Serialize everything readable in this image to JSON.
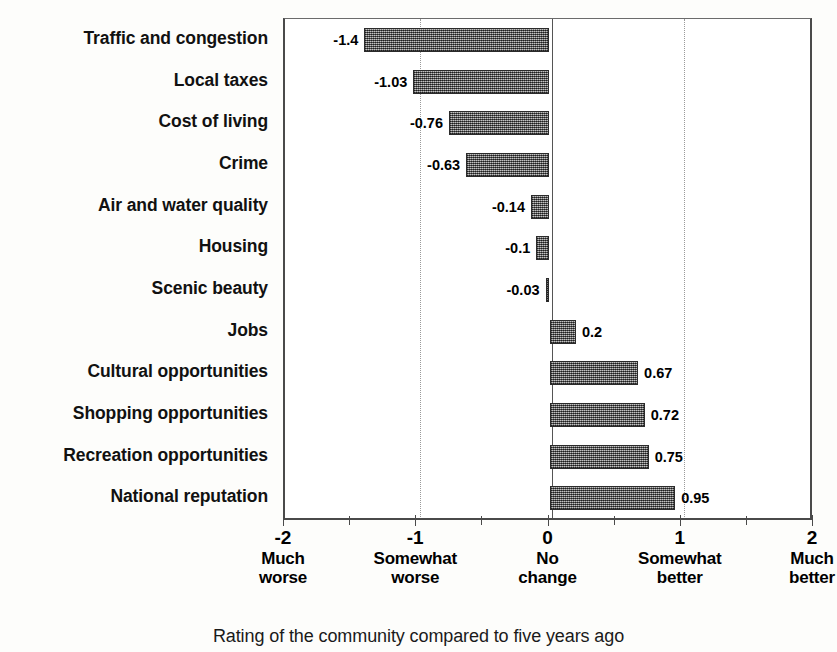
{
  "chart_data": {
    "type": "bar",
    "orientation": "horizontal",
    "title": "",
    "xlabel": "Rating of the community compared to five years ago",
    "ylabel": "",
    "xlim": [
      -2,
      2
    ],
    "grid": "dotted vertical gridlines at -1 and +1",
    "legend": "none",
    "categories": [
      "Traffic and congestion",
      "Local taxes",
      "Cost of living",
      "Crime",
      "Air and water quality",
      "Housing",
      "Scenic beauty",
      "Jobs",
      "Cultural opportunities",
      "Shopping opportunities",
      "Recreation opportunities",
      "National reputation"
    ],
    "values": [
      -1.4,
      -1.03,
      -0.76,
      -0.63,
      -0.14,
      -0.1,
      -0.03,
      0.2,
      0.67,
      0.72,
      0.75,
      0.95
    ],
    "value_labels": [
      "-1.4",
      "-1.03",
      "-0.76",
      "-0.63",
      "-0.14",
      "-0.1",
      "-0.03",
      "0.2",
      "0.67",
      "0.72",
      "0.75",
      "0.95"
    ],
    "xticks": [
      {
        "value": -2,
        "num": "-2",
        "line1": "Much",
        "line2": "worse"
      },
      {
        "value": -1,
        "num": "-1",
        "line1": "Somewhat",
        "line2": "worse"
      },
      {
        "value": 0,
        "num": "0",
        "line1": "No",
        "line2": "change"
      },
      {
        "value": 1,
        "num": "1",
        "line1": "Somewhat",
        "line2": "better"
      },
      {
        "value": 2,
        "num": "2",
        "line1": "Much",
        "line2": "better"
      }
    ],
    "minor_ticks": [
      -1.5,
      -0.5,
      0.5,
      1.5
    ],
    "gridlines": [
      -1,
      1
    ],
    "colors": {
      "bar_fill": "#8b8b8b",
      "bar_border": "#2b2b2b",
      "axis": "#4a4a4a",
      "gridline": "#9a9a9a",
      "text": "#000000",
      "background": "#fdfdfb"
    }
  }
}
